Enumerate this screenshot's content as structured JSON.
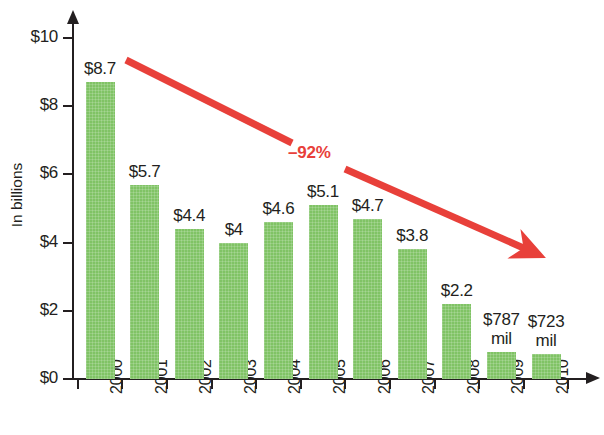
{
  "chart_data": {
    "type": "bar",
    "title": "",
    "xlabel": "",
    "ylabel": "In billions",
    "categories": [
      "2000",
      "2001",
      "2002",
      "2003",
      "2004",
      "2005",
      "2006",
      "2007",
      "2008",
      "2009",
      "2010"
    ],
    "values": [
      8.7,
      5.7,
      4.4,
      4,
      4.6,
      5.1,
      4.7,
      3.8,
      2.2,
      0.787,
      0.723
    ],
    "value_labels": [
      "$8.7",
      "$5.7",
      "$4.4",
      "$4",
      "$4.6",
      "$5.1",
      "$4.7",
      "$3.8",
      "$2.2",
      "$787\nmil",
      "$723\nmil"
    ],
    "ylim": [
      0,
      10
    ],
    "ytick_values": [
      0,
      2,
      4,
      6,
      8,
      10
    ],
    "ytick_labels": [
      "$0",
      "$2",
      "$4",
      "$6",
      "$8",
      "$10"
    ],
    "grid": false,
    "legend": null,
    "bar_color": "#80c365",
    "annotations": [
      {
        "name": "trend-arrow",
        "label": "–92%",
        "color": "#e8403a",
        "from": {
          "x": 2000,
          "y": 9.35
        },
        "to": {
          "x": 2010,
          "y": 3.55
        }
      }
    ]
  },
  "axes": {
    "y_title": "In billions",
    "y_ticks": [
      "$0",
      "$2",
      "$4",
      "$6",
      "$8",
      "$10"
    ],
    "x_ticks": [
      "2000",
      "2001",
      "2002",
      "2003",
      "2004",
      "2005",
      "2006",
      "2007",
      "2008",
      "2009",
      "2010"
    ]
  },
  "trend": {
    "label": "–92%",
    "color": "#e8403a"
  }
}
